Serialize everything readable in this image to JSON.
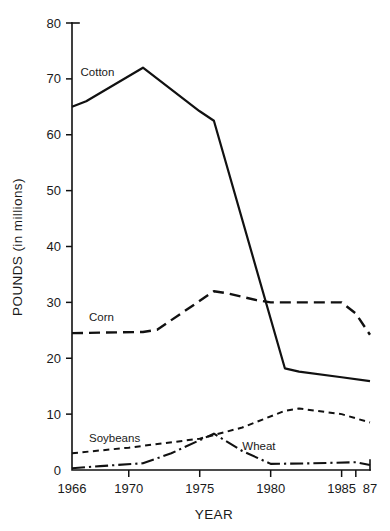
{
  "chart_data": {
    "type": "line",
    "title": "",
    "xlabel": "YEAR",
    "ylabel": "POUNDS (in millions)",
    "xlim": [
      1966,
      1987
    ],
    "ylim": [
      0,
      80
    ],
    "grid": false,
    "legend_position": "inline-labels",
    "y_ticks": [
      0,
      10,
      20,
      30,
      40,
      50,
      60,
      70,
      80
    ],
    "y_tick_labels": [
      "0",
      "10",
      "20",
      "30",
      "40",
      "50",
      "60",
      "70",
      "80"
    ],
    "x_ticks": [
      1966,
      1970,
      1975,
      1980,
      1985,
      1986,
      1987
    ],
    "x_tick_labels": [
      "1966",
      "1970",
      "1975",
      "1980",
      "1985",
      "",
      "87"
    ],
    "series": [
      {
        "name": "Cotton",
        "style": "solid",
        "label_x": 1966.6,
        "label_y": 70.6,
        "x": [
          1966,
          1967,
          1971,
          1975,
          1976,
          1981,
          1982,
          1985,
          1987
        ],
        "values": [
          65,
          66,
          72,
          64.2,
          62.5,
          18.2,
          17.6,
          16.6,
          15.9
        ]
      },
      {
        "name": "Corn",
        "style": "long-dash",
        "label_x": 1967.2,
        "label_y": 26.6,
        "x": [
          1966,
          1971,
          1972,
          1976,
          1977,
          1979,
          1980,
          1985,
          1986,
          1987
        ],
        "values": [
          24.5,
          24.7,
          25.1,
          32.0,
          31.6,
          30.4,
          30.0,
          30.0,
          28.0,
          24.2
        ]
      },
      {
        "name": "Soybeans",
        "style": "short-dash",
        "label_x": 1967.2,
        "label_y": 5.0,
        "x": [
          1966,
          1970,
          1975,
          1978,
          1981,
          1982,
          1985,
          1987
        ],
        "values": [
          3.0,
          4.0,
          5.6,
          7.6,
          10.6,
          11.0,
          10.0,
          8.5
        ]
      },
      {
        "name": "Wheat",
        "style": "dash-dot",
        "label_x": 1978.0,
        "label_y": 3.6,
        "x": [
          1966,
          1968,
          1971,
          1973,
          1976,
          1978,
          1980,
          1983,
          1986,
          1987
        ],
        "values": [
          0.3,
          0.7,
          1.2,
          3.0,
          6.5,
          3.4,
          1.1,
          1.2,
          1.4,
          0.9
        ]
      }
    ]
  },
  "colors": {
    "ink": "#111111",
    "background": "#ffffff"
  }
}
